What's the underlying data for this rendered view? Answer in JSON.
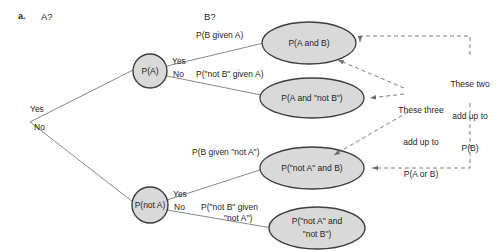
{
  "figure": {
    "part_label": "a.",
    "columns": [
      {
        "id": "col-a",
        "label": "A?"
      },
      {
        "id": "col-b",
        "label": "B?"
      }
    ]
  },
  "root": {
    "yes_label": "Yes",
    "no_label": "No"
  },
  "nodes": {
    "p_a": {
      "label": "P(A)",
      "shape": "circle"
    },
    "p_not_a": {
      "label": "P(not A)",
      "shape": "circle"
    },
    "p_a_and_b": {
      "label": "P(A and B)",
      "shape": "ellipse"
    },
    "p_a_and_not_b": {
      "label": "P(A and \"not B\")",
      "shape": "ellipse"
    },
    "p_not_a_and_b": {
      "label": "P(\"not A\" and B)",
      "shape": "ellipse"
    },
    "p_not_a_and_not_b_line1": "P(\"not A\" and",
    "p_not_a_and_not_b_line2": "\"not B\")"
  },
  "branches": {
    "a_yes": "Yes",
    "a_no": "No",
    "not_a_yes": "Yes",
    "not_a_no": "No"
  },
  "edge_labels": {
    "b_given_a": "P(B given A)",
    "not_b_given_a": "P(\"not B\" given A)",
    "b_given_not_a": "P(B given \"not A\")",
    "not_b_given_not_a_line1": "P(\"not B\" given",
    "not_b_given_not_a_line2": "\"not A\")"
  },
  "annotations": {
    "three": {
      "line1": "These three",
      "line2": "add up to",
      "line3": "P(A or B)"
    },
    "two": {
      "line1": "These two",
      "line2": "add up to",
      "line3": "P(B)"
    }
  },
  "colors": {
    "node_fill": "#d9d9d9",
    "node_stroke": "#3d3d3d",
    "line": "#7b7b7b",
    "text": "#231f20",
    "dashed": "#6d6d6d"
  }
}
